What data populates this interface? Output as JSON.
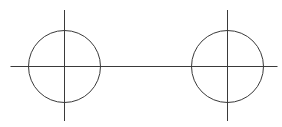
{
  "diagram": {
    "stroke_color": "#3a3a3a",
    "background": "#ffffff",
    "axis": {
      "x1": 10,
      "y1": 66,
      "x2": 277,
      "y2": 66
    },
    "circles": [
      {
        "name": "left",
        "cx": 64,
        "cy": 66,
        "r": 36,
        "vline": {
          "y1": 10,
          "y2": 121
        }
      },
      {
        "name": "right",
        "cx": 227,
        "cy": 66,
        "r": 36,
        "vline": {
          "y1": 10,
          "y2": 121
        }
      }
    ]
  }
}
